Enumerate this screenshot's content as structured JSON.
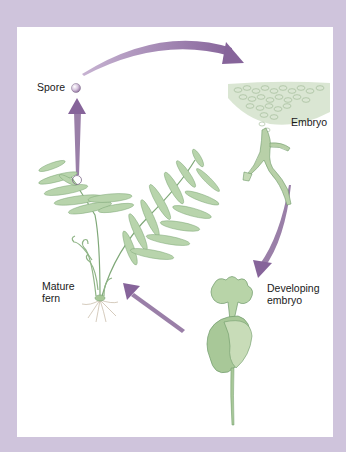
{
  "diagram": {
    "type": "life-cycle",
    "colors": {
      "frame": "#cfc4dc",
      "panel": "#ffffff",
      "arrow": "#8e6f9c",
      "plant": "#a8c8a0",
      "plant_stroke": "#6f9a6a",
      "soil": "#c9d9bf"
    },
    "labels": {
      "spore": "Spore",
      "embryo": "Embryo",
      "developing_embryo_line1": "Developing",
      "developing_embryo_line2": "embryo",
      "mature_fern_line1": "Mature",
      "mature_fern_line2": "fern"
    },
    "stages": [
      {
        "id": "spore",
        "label": "Spore"
      },
      {
        "id": "embryo",
        "label": "Embryo"
      },
      {
        "id": "developing-embryo",
        "label": "Developing embryo"
      },
      {
        "id": "mature-fern",
        "label": "Mature fern"
      }
    ],
    "arrows": [
      {
        "from": "mature-fern",
        "to": "spore"
      },
      {
        "from": "spore",
        "to": "embryo"
      },
      {
        "from": "embryo",
        "to": "developing-embryo"
      },
      {
        "from": "developing-embryo",
        "to": "mature-fern"
      }
    ]
  }
}
